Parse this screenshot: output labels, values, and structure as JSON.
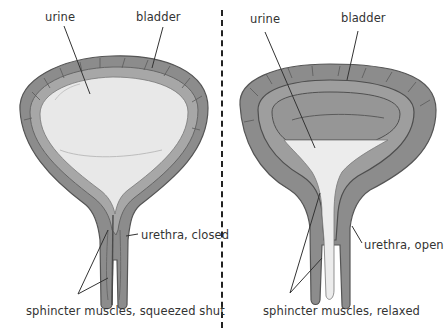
{
  "diagram": {
    "panels": [
      {
        "id": "closed",
        "labels": {
          "urine": "urine",
          "bladder": "bladder",
          "urethra": "urethra, closed",
          "sphincter": "sphincter muscles, squeezed shut"
        }
      },
      {
        "id": "open",
        "labels": {
          "urine": "urine",
          "bladder": "bladder",
          "urethra": "urethra, open",
          "sphincter": "sphincter muscles, relaxed"
        }
      }
    ],
    "colors": {
      "wall_outer": "#8a8a8a",
      "wall_inner": "#a3a3a3",
      "urine_fill": "#e6e6e6",
      "empty_cavity": "#9a9a9a",
      "line": "#333333",
      "divider": "#222222"
    }
  }
}
